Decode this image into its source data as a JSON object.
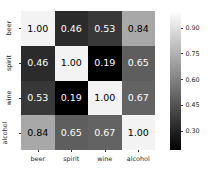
{
  "chart_data": {
    "type": "heatmap",
    "title": "",
    "xlabel": "",
    "ylabel": "",
    "categories": [
      "beer",
      "spirit",
      "wine",
      "alcohol"
    ],
    "x_tick_labels": [
      "beer",
      "spirit",
      "wine",
      "alcohol"
    ],
    "y_tick_labels": [
      "beer",
      "spirit",
      "wine",
      "alcohol"
    ],
    "colormap": "gray",
    "grid": false,
    "annotate": true,
    "annotation_format": "0.2f",
    "vmin": 0.19,
    "vmax": 1.0,
    "matrix": [
      [
        1.0,
        0.46,
        0.53,
        0.84
      ],
      [
        0.46,
        1.0,
        0.19,
        0.65
      ],
      [
        0.53,
        0.19,
        1.0,
        0.67
      ],
      [
        0.84,
        0.65,
        0.67,
        1.0
      ]
    ],
    "cells": [
      {
        "row": 0,
        "col": 0,
        "row_label": "beer",
        "col_label": "beer",
        "value": 1.0,
        "text": "1.00",
        "fill": "#f3f3f3",
        "text_color": "#000000"
      },
      {
        "row": 0,
        "col": 1,
        "row_label": "beer",
        "col_label": "spirit",
        "value": 0.46,
        "text": "0.46",
        "fill": "#2b2b2b",
        "text_color": "#ffffff"
      },
      {
        "row": 0,
        "col": 2,
        "row_label": "beer",
        "col_label": "wine",
        "value": 0.53,
        "text": "0.53",
        "fill": "#383838",
        "text_color": "#ffffff"
      },
      {
        "row": 0,
        "col": 3,
        "row_label": "beer",
        "col_label": "alcohol",
        "value": 0.84,
        "text": "0.84",
        "fill": "#a8a8a8",
        "text_color": "#000000"
      },
      {
        "row": 1,
        "col": 0,
        "row_label": "spirit",
        "col_label": "beer",
        "value": 0.46,
        "text": "0.46",
        "fill": "#2b2b2b",
        "text_color": "#ffffff"
      },
      {
        "row": 1,
        "col": 1,
        "row_label": "spirit",
        "col_label": "spirit",
        "value": 1.0,
        "text": "1.00",
        "fill": "#f3f3f3",
        "text_color": "#000000"
      },
      {
        "row": 1,
        "col": 2,
        "row_label": "spirit",
        "col_label": "wine",
        "value": 0.19,
        "text": "0.19",
        "fill": "#000000",
        "text_color": "#ffffff"
      },
      {
        "row": 1,
        "col": 3,
        "row_label": "spirit",
        "col_label": "alcohol",
        "value": 0.65,
        "text": "0.65",
        "fill": "#5e5e5e",
        "text_color": "#ffffff"
      },
      {
        "row": 2,
        "col": 0,
        "row_label": "wine",
        "col_label": "beer",
        "value": 0.53,
        "text": "0.53",
        "fill": "#383838",
        "text_color": "#ffffff"
      },
      {
        "row": 2,
        "col": 1,
        "row_label": "wine",
        "col_label": "spirit",
        "value": 0.19,
        "text": "0.19",
        "fill": "#000000",
        "text_color": "#ffffff"
      },
      {
        "row": 2,
        "col": 2,
        "row_label": "wine",
        "col_label": "wine",
        "value": 1.0,
        "text": "1.00",
        "fill": "#f3f3f3",
        "text_color": "#000000"
      },
      {
        "row": 2,
        "col": 3,
        "row_label": "wine",
        "col_label": "alcohol",
        "value": 0.67,
        "text": "0.67",
        "fill": "#636363",
        "text_color": "#ffffff"
      },
      {
        "row": 3,
        "col": 0,
        "row_label": "alcohol",
        "col_label": "beer",
        "value": 0.84,
        "text": "0.84",
        "fill": "#a8a8a8",
        "text_color": "#000000"
      },
      {
        "row": 3,
        "col": 1,
        "row_label": "alcohol",
        "col_label": "spirit",
        "value": 0.65,
        "text": "0.65",
        "fill": "#5e5e5e",
        "text_color": "#ffffff"
      },
      {
        "row": 3,
        "col": 2,
        "row_label": "alcohol",
        "col_label": "wine",
        "value": 0.67,
        "text": "0.67",
        "fill": "#636363",
        "text_color": "#ffffff"
      },
      {
        "row": 3,
        "col": 3,
        "row_label": "alcohol",
        "col_label": "alcohol",
        "value": 1.0,
        "text": "1.00",
        "fill": "#f3f3f3",
        "text_color": "#000000"
      }
    ],
    "colorbar": {
      "orientation": "vertical",
      "position": "right",
      "tick_labels": [
        "0.90",
        "0.75",
        "0.60",
        "0.45",
        "0.30"
      ],
      "tick_values": [
        0.9,
        0.75,
        0.6,
        0.45,
        0.3
      ],
      "gradient_top_color": "#ffffff",
      "gradient_bottom_color": "#000000",
      "range": [
        0.19,
        1.0
      ]
    }
  }
}
